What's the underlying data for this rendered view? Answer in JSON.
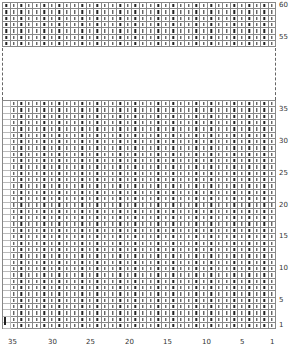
{
  "chart": {
    "columns": 36,
    "symbol": "knit-stitch",
    "top_block": {
      "rows": [
        60,
        59,
        58,
        57,
        56,
        55,
        54
      ]
    },
    "bottom_block": {
      "row_start": 36,
      "row_end": 1
    },
    "row_labels": [
      {
        "label": "60",
        "row": 60
      },
      {
        "label": "55",
        "row": 55
      },
      {
        "label": "35",
        "row": 35
      },
      {
        "label": "30",
        "row": 30
      },
      {
        "label": "25",
        "row": 25
      },
      {
        "label": "20",
        "row": 20
      },
      {
        "label": "15",
        "row": 15
      },
      {
        "label": "10",
        "row": 10
      },
      {
        "label": "5",
        "row": 5
      },
      {
        "label": "1",
        "row": 1
      }
    ],
    "column_labels": [
      "35",
      "30",
      "25",
      "20",
      "15",
      "10",
      "5",
      "1"
    ]
  },
  "colors": {
    "grid": "#888888",
    "symbol": "#222222"
  }
}
